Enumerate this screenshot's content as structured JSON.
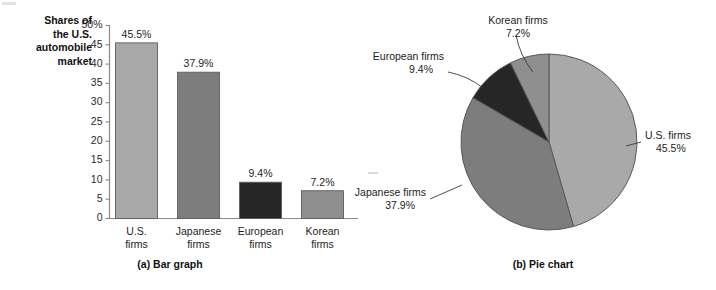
{
  "figure": {
    "axis_title_lines": [
      "Shares of",
      "the U.S.",
      "automobile",
      "market"
    ],
    "bar_caption": "(a) Bar graph",
    "pie_caption": "(b) Pie chart"
  },
  "colors": {
    "us": "#a9a9a9",
    "japanese": "#7d7d7d",
    "european": "#262626",
    "korean": "#8f8f8f",
    "outline": "#5a5a5a",
    "axis": "#8a8a8a",
    "text": "#1d1d1d"
  },
  "chart_data": [
    {
      "type": "bar",
      "title": "(a) Bar graph",
      "categories": [
        "U.S. firms",
        "Japanese firms",
        "European firms",
        "Korean firms"
      ],
      "category_lines": [
        [
          "U.S.",
          "firms"
        ],
        [
          "Japanese",
          "firms"
        ],
        [
          "European",
          "firms"
        ],
        [
          "Korean",
          "firms"
        ]
      ],
      "values": [
        45.5,
        37.9,
        9.4,
        7.2
      ],
      "value_labels": [
        "45.5%",
        "37.9%",
        "9.4%",
        "7.2%"
      ],
      "bar_colors": [
        "#a9a9a9",
        "#7d7d7d",
        "#262626",
        "#8f8f8f"
      ],
      "xlabel": "",
      "ylabel": "Shares of the U.S. automobile market",
      "ylim": [
        0,
        50
      ],
      "yticks": [
        0,
        5,
        10,
        15,
        20,
        25,
        30,
        35,
        40,
        45,
        50
      ],
      "ytick_labels": [
        "0",
        "5",
        "10",
        "15",
        "20",
        "25",
        "30",
        "35",
        "40",
        "45",
        "50%"
      ],
      "grid": false,
      "legend": "none"
    },
    {
      "type": "pie",
      "title": "(b) Pie chart",
      "labels": [
        "U.S. firms",
        "Japanese firms",
        "European firms",
        "Korean firms"
      ],
      "values": [
        45.5,
        37.9,
        9.4,
        7.2
      ],
      "value_labels": [
        "45.5%",
        "37.9%",
        "9.4%",
        "7.2%"
      ],
      "slice_colors": [
        "#a9a9a9",
        "#7d7d7d",
        "#262626",
        "#8f8f8f"
      ],
      "start_angle_deg": 0,
      "direction": "clockwise",
      "legend": "leader-line callouts"
    }
  ],
  "bar_chart": {
    "ytick_labels": [
      "50%",
      "45",
      "40",
      "35",
      "30",
      "25",
      "20",
      "15",
      "10",
      "5",
      "0"
    ],
    "bars": [
      {
        "name": "us",
        "value_label": "45.5%",
        "line1": "U.S.",
        "line2": "firms"
      },
      {
        "name": "japanese",
        "value_label": "37.9%",
        "line1": "Japanese",
        "line2": "firms"
      },
      {
        "name": "european",
        "value_label": "9.4%",
        "line1": "European",
        "line2": "firms"
      },
      {
        "name": "korean",
        "value_label": "7.2%",
        "line1": "Korean",
        "line2": "firms"
      }
    ]
  },
  "pie_chart": {
    "callouts": [
      {
        "name": "us",
        "line1": "U.S. firms",
        "line2": "45.5%"
      },
      {
        "name": "japanese",
        "line1": "Japanese firms",
        "line2": "37.9%"
      },
      {
        "name": "european",
        "line1": "European firms",
        "line2": "9.4%"
      },
      {
        "name": "korean",
        "line1": "Korean firms",
        "line2": "7.2%"
      }
    ]
  }
}
